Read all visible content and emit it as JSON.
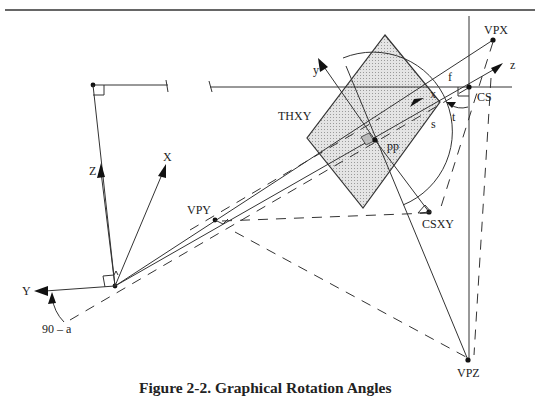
{
  "figure": {
    "caption": "Figure 2-2.  Graphical Rotation Angles",
    "labels": {
      "vpx": "VPX",
      "vpy": "VPY",
      "vpz": "VPZ",
      "cs": "CS",
      "csxy": "CSXY",
      "thxy": "THXY",
      "pp": "pp",
      "f": "f",
      "s": "s",
      "t": "t",
      "x_lower": "x",
      "y_lower": "y",
      "z_lower": "z",
      "X_upper": "X",
      "Y_upper": "Y",
      "Z_upper": "Z",
      "angle": "90 – a"
    },
    "colors": {
      "line": "#333333",
      "fill": "#d9d9d9",
      "background": "#ffffff"
    }
  }
}
